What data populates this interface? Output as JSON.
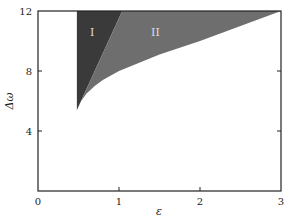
{
  "chart_data": {
    "type": "area",
    "title": "",
    "xlabel": "ε",
    "ylabel": "Δω",
    "xlim": [
      0,
      3
    ],
    "ylim": [
      0,
      12
    ],
    "xticks": [
      0,
      1,
      2,
      3
    ],
    "yticks": [
      4,
      8,
      12
    ],
    "xtick_labels": [
      "0",
      "1",
      "2",
      "3"
    ],
    "ytick_labels": [
      "4",
      "8",
      "12"
    ],
    "grid": false,
    "legend": null,
    "regions": [
      {
        "name": "I",
        "label": "I",
        "color": "#3a3a3a",
        "boundary": [
          [
            0.48,
            5.4
          ],
          [
            0.48,
            12.0
          ],
          [
            1.04,
            12.0
          ],
          [
            0.48,
            5.4
          ]
        ]
      },
      {
        "name": "II",
        "label": "II",
        "color": "#6e6e6e",
        "boundary": [
          [
            0.48,
            5.4
          ],
          [
            1.04,
            12.0
          ],
          [
            3.0,
            12.0
          ],
          [
            2.0,
            10.0
          ],
          [
            1.5,
            9.1
          ],
          [
            1.0,
            8.0
          ],
          [
            0.9,
            7.7
          ],
          [
            0.8,
            7.4
          ],
          [
            0.7,
            7.0
          ],
          [
            0.6,
            6.5
          ],
          [
            0.52,
            5.9
          ],
          [
            0.48,
            5.4
          ]
        ]
      }
    ],
    "annotations": [
      {
        "text": "I",
        "x": 0.67,
        "y": 10.6
      },
      {
        "text": "II",
        "x": 1.45,
        "y": 10.6
      }
    ]
  }
}
